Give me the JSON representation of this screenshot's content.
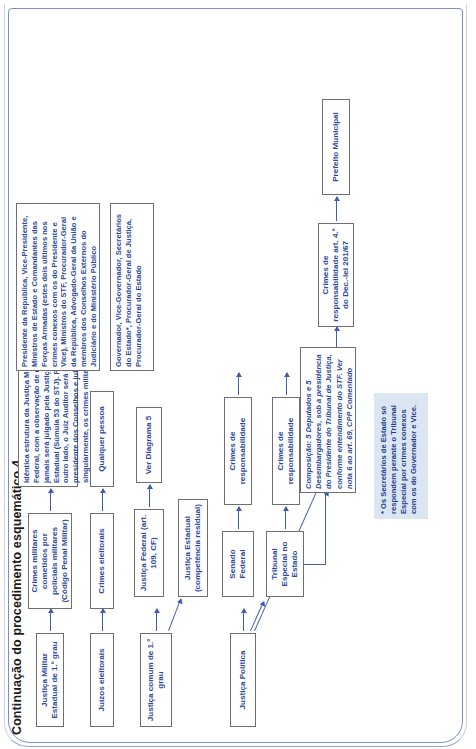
{
  "document": {
    "title": "Continuação do procedimento esquemático 4."
  },
  "diagram": {
    "type": "flowchart",
    "orientation": "left-to-right (page rotated 90°)",
    "colors": {
      "box_text": "#2b4a9b",
      "box_border": "#6f6f6f",
      "arrow": "#3f5fae",
      "note_background": "#dce6f2",
      "page_frame": "#7b8fc4"
    },
    "columns": [
      {
        "name": "courts",
        "nodes": [
          {
            "id": "justica-militar-estadual",
            "label": "Justiça Militar Estadual de 1.º grau"
          },
          {
            "id": "juizos-eleitorais",
            "label": "Juízos eleitorais"
          },
          {
            "id": "justica-comum",
            "label": "Justiça comum de 1.º grau"
          },
          {
            "id": "justica-politica",
            "label": "Justiça Política"
          }
        ]
      },
      {
        "name": "second",
        "nodes": [
          {
            "id": "crimes-militares",
            "label": "Crimes militares cometidos por policiais militares (Código Penal Militar)"
          },
          {
            "id": "crimes-eleitorais",
            "label": "Crimes eleitorais"
          },
          {
            "id": "justica-federal",
            "label": "Justiça Federal (art. 109, CF)"
          },
          {
            "id": "justica-estadual",
            "label": "Justiça Estadual (competência residual)"
          },
          {
            "id": "senado-federal",
            "label": "Senado Federal"
          },
          {
            "id": "tribunal-especial",
            "label": "Tribunal Especial no Estado"
          },
          {
            "id": "camara-municipal",
            "label": "Câmara Municipal"
          }
        ]
      },
      {
        "name": "third",
        "nodes": [
          {
            "id": "identica-estrutura",
            "label": "Idêntica estrutura da Justiça Militar Federal, com a observação de que civil jamais será julgado pela Justiça Militar Estadual (Súmula 53 do STJ). Por outro lado, o Juiz Auditor será o presidente dos Conselhos e julgará, singularmente, os crimes militares contra civis"
          },
          {
            "id": "qualquer-pessoa",
            "label": "Qualquer pessoa"
          },
          {
            "id": "ver-diagrama-5",
            "label": "Ver Diagrama 5"
          },
          {
            "id": "crimes-responsabilidade-1",
            "label": "Crimes de responsabilidade"
          },
          {
            "id": "crimes-responsabilidade-2",
            "label": "Crimes de responsabilidade"
          },
          {
            "id": "crimes-responsabilidade-municipal",
            "label": "Crimes de responsabilidade art. 4.º do Dec.-lei 201/67"
          },
          {
            "id": "composicao",
            "label": "Composição: 5 Deputados e 5 Desembargadores, sob a presidência do Presidente do Tribunal de Justiça, conforme entendimento do STF. Ver nota 6 ao art. 69, CPP Comentado"
          }
        ]
      },
      {
        "name": "fourth",
        "nodes": [
          {
            "id": "autoridades-federais",
            "label": "Presidente da República, Vice-Presidente, Ministros de Estado e Comandantes das Forças Armadas (estes dois últimos nos crimes conexos com os do Presidente e Vice), Ministros do STF, Procurador-Geral da República, Advogado-Geral da União e membros dos Conselhos Externos do Judiciário e do Ministério Público"
          },
          {
            "id": "autoridades-estaduais",
            "label": "Governador, Vice-Governador, Secretários do Estado*, Procurador-Geral de Justiça, Procurador-Geral do Estado"
          },
          {
            "id": "prefeito-municipal",
            "label": "Prefeito Municipal"
          }
        ]
      }
    ],
    "footnote": {
      "id": "footnote-secretarios",
      "text": "* Os Secretários de Estado só respondem perante o Tribunal Especial por crimes conexos com os do Governador e Vice."
    },
    "edges": [
      {
        "from": "justica-militar-estadual",
        "to": "crimes-militares"
      },
      {
        "from": "crimes-militares",
        "to": "identica-estrutura"
      },
      {
        "from": "juizos-eleitorais",
        "to": "crimes-eleitorais"
      },
      {
        "from": "crimes-eleitorais",
        "to": "qualquer-pessoa"
      },
      {
        "from": "justica-comum",
        "to": "justica-federal"
      },
      {
        "from": "justica-comum",
        "to": "justica-estadual"
      },
      {
        "from": "justica-federal",
        "to": "ver-diagrama-5"
      },
      {
        "from": "justica-politica",
        "to": "senado-federal"
      },
      {
        "from": "justica-politica",
        "to": "tribunal-especial"
      },
      {
        "from": "justica-politica",
        "to": "camara-municipal"
      },
      {
        "from": "senado-federal",
        "to": "crimes-responsabilidade-1"
      },
      {
        "from": "crimes-responsabilidade-1",
        "to": "autoridades-federais"
      },
      {
        "from": "tribunal-especial",
        "to": "crimes-responsabilidade-2"
      },
      {
        "from": "tribunal-especial",
        "to": "composicao"
      },
      {
        "from": "crimes-responsabilidade-2",
        "to": "autoridades-estaduais"
      },
      {
        "from": "camara-municipal",
        "to": "crimes-responsabilidade-municipal"
      },
      {
        "from": "crimes-responsabilidade-municipal",
        "to": "prefeito-municipal"
      }
    ]
  }
}
